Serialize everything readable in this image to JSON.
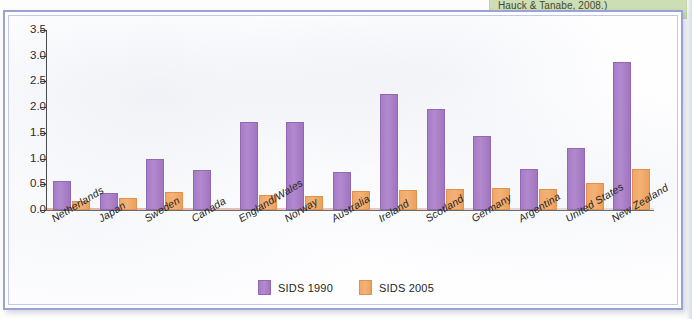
{
  "caption": {
    "text": "Hauck & Tanabe, 2008.)"
  },
  "legend": {
    "position": "bottom-center",
    "items": [
      {
        "label": "SIDS 1990",
        "color": "#a87cc6",
        "swatch_name": "legend-swatch-sids-1990"
      },
      {
        "label": "SIDS 2005",
        "color": "#f0a868",
        "swatch_name": "legend-swatch-sids-2005"
      }
    ]
  },
  "chart_data": {
    "type": "bar",
    "title": "",
    "subtitle": "",
    "xlabel": "",
    "ylabel": "",
    "ylim": [
      0.0,
      3.5
    ],
    "ytick_labels": [
      "0.0",
      "0.5",
      "1.0",
      "1.5",
      "2.0",
      "2.5",
      "3.0",
      "3.5"
    ],
    "ytick_values": [
      0.0,
      0.5,
      1.0,
      1.5,
      2.0,
      2.5,
      3.0,
      3.5
    ],
    "grid": false,
    "legend_position": "bottom-center",
    "categories": [
      "Netherlands",
      "Japan",
      "Sweden",
      "Canada",
      "England/Wales",
      "Norway",
      "Australia",
      "Ireland",
      "Scotland",
      "Germany",
      "Argentina",
      "United States",
      "New Zealand"
    ],
    "series": [
      {
        "name": "SIDS 1990",
        "color": "#a87cc6",
        "values": [
          0.57,
          0.33,
          1.0,
          0.77,
          1.71,
          1.71,
          0.73,
          2.26,
          1.97,
          1.43,
          0.8,
          1.2,
          2.88
        ]
      },
      {
        "name": "SIDS 2005",
        "color": "#f0a868",
        "values": [
          0.17,
          0.23,
          0.35,
          0.0,
          0.3,
          0.27,
          0.37,
          0.39,
          0.41,
          0.43,
          0.4,
          0.52,
          0.79
        ]
      }
    ]
  },
  "colors": {
    "frame_border": "#9aa3d6",
    "caption_background": "#cdddb4",
    "axis": "#4a4a4a",
    "plot_background": "#fefeff"
  }
}
